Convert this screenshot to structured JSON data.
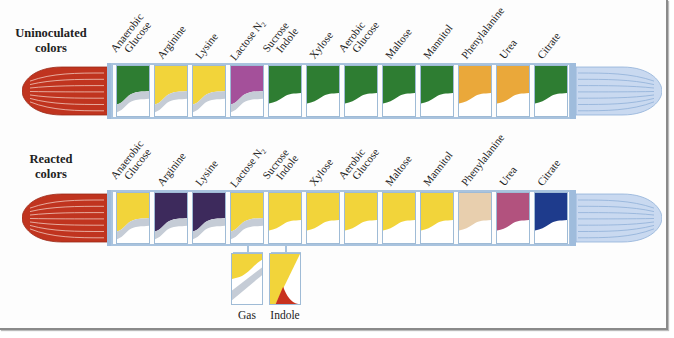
{
  "rows": [
    {
      "id": "uninoculated",
      "label_line1": "Uninoculated",
      "label_line2": "colors",
      "tip_left_color": "#c0341f",
      "tip_right_color": "#c9d9f0",
      "tests": [
        {
          "line1": "Anaerobic",
          "line2": "Glucose",
          "color": "#2e7d32",
          "gray_band": true
        },
        {
          "line1": "Arginine",
          "line2": "",
          "color": "#f2d43a",
          "gray_band": true
        },
        {
          "line1": "Lysine",
          "line2": "",
          "color": "#f2d43a",
          "gray_band": true
        },
        {
          "line1": "Lactose N",
          "sub": "2",
          "line2": "",
          "color": "#a4509a",
          "gray_band": true
        },
        {
          "line1": "Sucrose",
          "line2": "Indole",
          "color": "#2e7d32",
          "gray_band": false
        },
        {
          "line1": "Xylose",
          "line2": "",
          "color": "#2e7d32",
          "gray_band": false
        },
        {
          "line1": "Aerobic",
          "line2": "Glucose",
          "color": "#2e7d32",
          "gray_band": false
        },
        {
          "line1": "Maltose",
          "line2": "",
          "color": "#2e7d32",
          "gray_band": false
        },
        {
          "line1": "Mannitol",
          "line2": "",
          "color": "#2e7d32",
          "gray_band": false
        },
        {
          "line1": "Phenylalanine",
          "line2": "",
          "color": "#eaa83a",
          "gray_band": false
        },
        {
          "line1": "Urea",
          "line2": "",
          "color": "#eaa83a",
          "gray_band": false
        },
        {
          "line1": "Citrate",
          "line2": "",
          "color": "#2e7d32",
          "gray_band": false
        }
      ]
    },
    {
      "id": "reacted",
      "label_line1": "Reacted",
      "label_line2": "colors",
      "tip_left_color": "#c0341f",
      "tip_right_color": "#c9d9f0",
      "tests": [
        {
          "line1": "Anaerobic",
          "line2": "Glucose",
          "color": "#f2d43a",
          "gray_band": true
        },
        {
          "line1": "Arginine",
          "line2": "",
          "color": "#3d2a5c",
          "gray_band": true
        },
        {
          "line1": "Lysine",
          "line2": "",
          "color": "#3d2a5c",
          "gray_band": true
        },
        {
          "line1": "Lactose N",
          "sub": "2",
          "line2": "",
          "color": "#f2d43a",
          "gray_band": true
        },
        {
          "line1": "Sucrose",
          "line2": "Indole",
          "color": "#f2d43a",
          "gray_band": false
        },
        {
          "line1": "Xylose",
          "line2": "",
          "color": "#f2d43a",
          "gray_band": false
        },
        {
          "line1": "Aerobic",
          "line2": "Glucose",
          "color": "#f2d43a",
          "gray_band": false
        },
        {
          "line1": "Maltose",
          "line2": "",
          "color": "#f2d43a",
          "gray_band": false
        },
        {
          "line1": "Mannitol",
          "line2": "",
          "color": "#f2d43a",
          "gray_band": false
        },
        {
          "line1": "Phenylalanine",
          "line2": "",
          "color": "#e8cfae",
          "gray_band": false
        },
        {
          "line1": "Urea",
          "line2": "",
          "color": "#b2527e",
          "gray_band": false
        },
        {
          "line1": "Citrate",
          "line2": "",
          "color": "#1e3b8c",
          "gray_band": false
        }
      ]
    }
  ],
  "details": [
    {
      "label": "Gas",
      "color": "#f2d43a",
      "type": "gas"
    },
    {
      "label": "Indole",
      "color": "#f2d43a",
      "accent": "#c8321e",
      "type": "indole"
    }
  ],
  "colors": {
    "frame": "#a9c3de",
    "gray_band": "#c5ccd6"
  }
}
